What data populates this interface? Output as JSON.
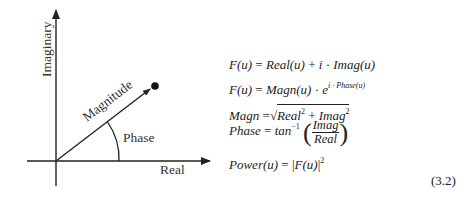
{
  "diagram": {
    "axes": {
      "x_label": "Real",
      "y_label": "Imaginary"
    },
    "vector_label": "Magnitude",
    "angle_label": "Phase"
  },
  "equations": {
    "eq1": {
      "lhs": "F(u)",
      "eq": " = ",
      "t1": "Real(u)",
      "plus": " + ",
      "i": "i",
      "dot": " · ",
      "t2": "Imag(u)"
    },
    "eq2": {
      "lhs": "F(u)",
      "eq": " = ",
      "t1": "Magn(u)",
      "dot": " · ",
      "base": "e",
      "exp": "i · Phase(u)"
    },
    "eq3": {
      "lhs": "Magn",
      "eq": " =",
      "root_sign": "√",
      "a": "Real",
      "a_pow": "2",
      "plus": " + ",
      "b": "Imag",
      "b_pow": "2"
    },
    "eq4": {
      "lhs": "Phase",
      "eq": " = ",
      "fn": "tan",
      "fn_pow": "−1",
      "lparen": "(",
      "num": "Imag",
      "den": "Real",
      "rparen": ")"
    },
    "eq5": {
      "lhs": "Power(u)",
      "eq": " = ",
      "bar_l": "|",
      "inner": "F(u)",
      "bar_r": "|",
      "pow": "2"
    },
    "number": "(3.2)"
  }
}
